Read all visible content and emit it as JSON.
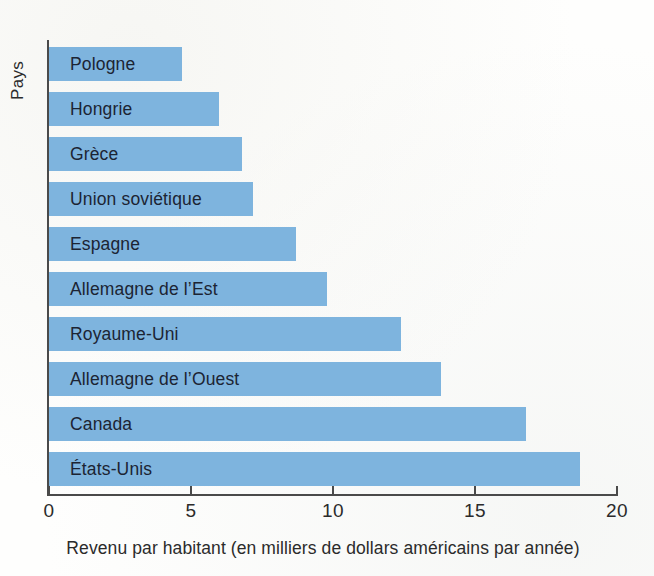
{
  "chart_data": {
    "type": "bar",
    "orientation": "horizontal",
    "title": "",
    "xlabel": "Revenu par habitant (en milliers de dollars américains par année)",
    "ylabel": "Pays",
    "xlim": [
      0,
      20
    ],
    "xticks": [
      "0",
      "5",
      "10",
      "15",
      "20"
    ],
    "xtick_values": [
      0,
      5,
      10,
      15,
      20
    ],
    "grid": false,
    "legend": null,
    "bar_color": "#7eb4de",
    "categories": [
      "Pologne",
      "Hongrie",
      "Grèce",
      "Union soviétique",
      "Espagne",
      "Allemagne de l’Est",
      "Royaume-Uni",
      "Allemagne de l’Ouest",
      "Canada",
      "États-Unis"
    ],
    "values": [
      4.7,
      6.0,
      6.8,
      7.2,
      8.7,
      9.8,
      12.4,
      13.8,
      16.8,
      18.7
    ]
  }
}
